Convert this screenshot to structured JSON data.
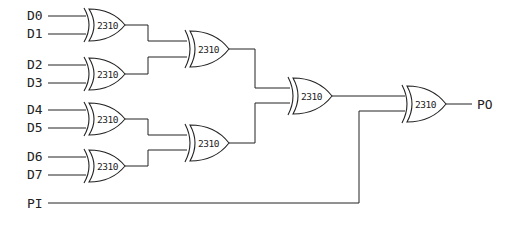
{
  "diagram": {
    "type": "logic-circuit",
    "inputs": [
      {
        "label": "D0",
        "y": 16
      },
      {
        "label": "D1",
        "y": 34
      },
      {
        "label": "D2",
        "y": 65
      },
      {
        "label": "D3",
        "y": 83
      },
      {
        "label": "D4",
        "y": 110
      },
      {
        "label": "D5",
        "y": 128
      },
      {
        "label": "D6",
        "y": 157
      },
      {
        "label": "D7",
        "y": 175
      }
    ],
    "parity_in": {
      "label": "PI"
    },
    "parity_out": {
      "label": "PO"
    },
    "gates": [
      {
        "id": "g1",
        "label": "2310",
        "type": "XOR",
        "inputs": [
          "D0",
          "D1"
        ]
      },
      {
        "id": "g2",
        "label": "2310",
        "type": "XOR",
        "inputs": [
          "D2",
          "D3"
        ]
      },
      {
        "id": "g3",
        "label": "2310",
        "type": "XOR",
        "inputs": [
          "D4",
          "D5"
        ]
      },
      {
        "id": "g4",
        "label": "2310",
        "type": "XOR",
        "inputs": [
          "D6",
          "D7"
        ]
      },
      {
        "id": "g5",
        "label": "2310",
        "type": "XOR",
        "inputs": [
          "g1",
          "g2"
        ]
      },
      {
        "id": "g6",
        "label": "2310",
        "type": "XOR",
        "inputs": [
          "g3",
          "g4"
        ]
      },
      {
        "id": "g7",
        "label": "2310",
        "type": "XOR",
        "inputs": [
          "g5",
          "g6"
        ]
      },
      {
        "id": "g8",
        "label": "2310",
        "type": "XOR",
        "inputs": [
          "g7",
          "PI"
        ]
      }
    ]
  }
}
